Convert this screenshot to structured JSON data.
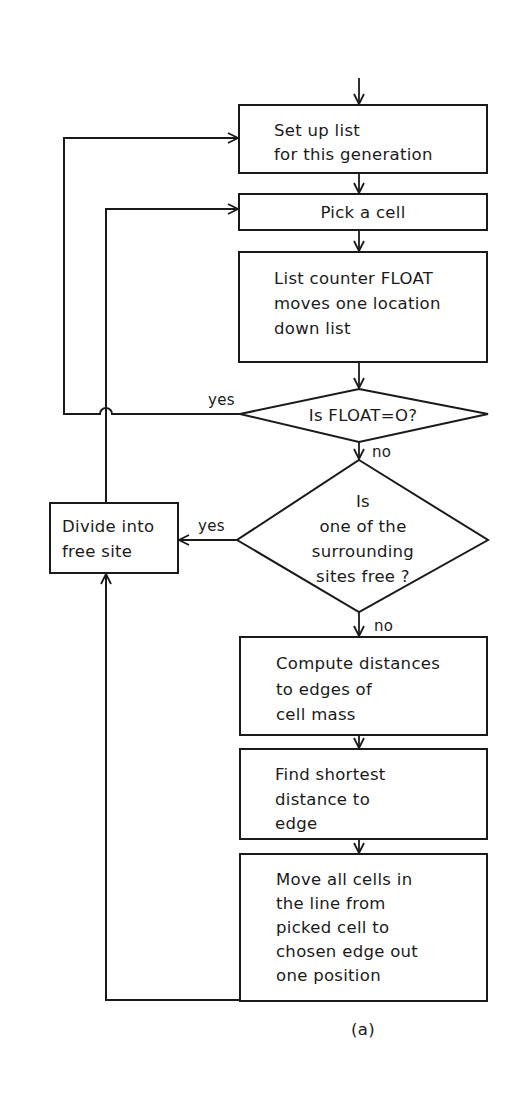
{
  "figure": {
    "caption": "(a)",
    "nodes": {
      "setup": {
        "lines": [
          "Set up list",
          "for this generation"
        ]
      },
      "pick": {
        "lines": [
          "Pick a cell"
        ]
      },
      "counter": {
        "lines": [
          "List counter  FLOAT",
          "moves one location",
          "down list"
        ]
      },
      "float_check": {
        "lines": [
          "Is  FLOAT=O?"
        ]
      },
      "free_check": {
        "lines": [
          "Is",
          "one of the",
          "surrounding",
          "sites free ?"
        ]
      },
      "divide": {
        "lines": [
          "Divide into",
          "free site"
        ]
      },
      "compute": {
        "lines": [
          "Compute distances",
          "to edges of",
          "cell mass"
        ]
      },
      "shortest": {
        "lines": [
          "Find shortest",
          "distance to",
          "edge"
        ]
      },
      "move": {
        "lines": [
          "Move all cells in",
          "the line from",
          "picked cell to",
          "chosen edge out",
          "one position"
        ]
      }
    },
    "edge_labels": {
      "float_yes": "yes",
      "float_no": "no",
      "free_yes": "yes",
      "free_no": "no"
    }
  }
}
